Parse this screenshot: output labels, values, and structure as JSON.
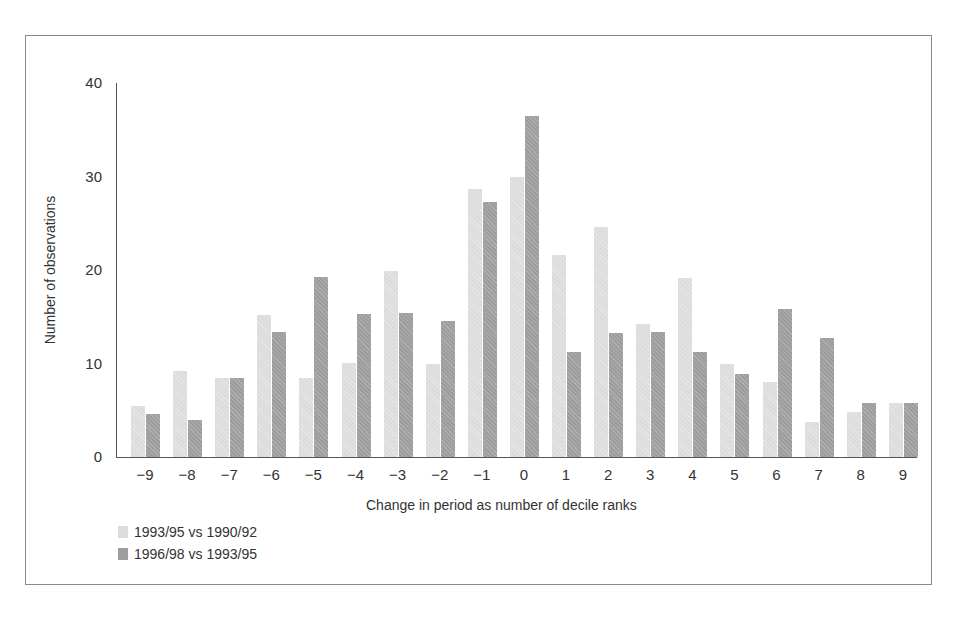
{
  "chart_data": {
    "type": "bar",
    "title": "",
    "xlabel": "Change in period as number of decile ranks",
    "ylabel": "Number of observations",
    "ylim": [
      0,
      40
    ],
    "yticks": [
      0,
      10,
      20,
      30,
      40
    ],
    "grid": false,
    "legend_position": "bottom-left",
    "categories": [
      "−9",
      "−8",
      "−7",
      "−6",
      "−5",
      "−4",
      "−3",
      "−2",
      "−1",
      "0",
      "1",
      "2",
      "3",
      "4",
      "5",
      "6",
      "7",
      "8",
      "9"
    ],
    "series": [
      {
        "name": "1993/95 vs 1990/92",
        "color": "#dcdcdc",
        "values": [
          5.5,
          9.2,
          8.4,
          15.2,
          8.4,
          10.1,
          19.9,
          10.0,
          28.7,
          29.9,
          21.6,
          24.6,
          14.2,
          19.1,
          9.9,
          8.0,
          3.7,
          4.8,
          5.8
        ]
      },
      {
        "name": "1996/98 vs 1993/95",
        "color": "#9d9d9d",
        "values": [
          4.6,
          4.0,
          8.4,
          13.4,
          19.3,
          15.3,
          15.4,
          14.6,
          27.3,
          36.5,
          11.2,
          13.3,
          13.4,
          11.2,
          8.9,
          15.8,
          12.7,
          5.8,
          5.8
        ]
      }
    ]
  }
}
